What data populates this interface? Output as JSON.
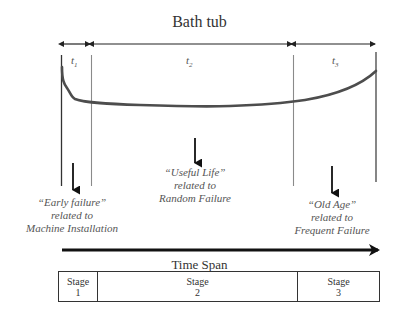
{
  "title": "Bath tub",
  "phases": [
    {
      "id": "t1",
      "label": "t",
      "sub": "1"
    },
    {
      "id": "t2",
      "label": "t",
      "sub": "2"
    },
    {
      "id": "t3",
      "label": "t",
      "sub": "3"
    }
  ],
  "annotations": {
    "early": {
      "line1": "“Early failure”",
      "line2": "related to",
      "line3": "Machine Installation"
    },
    "useful": {
      "line1": "“Useful Life”",
      "line2": "related to",
      "line3": "Random Failure"
    },
    "old": {
      "line1": "“Old Age”",
      "line2": "related to",
      "line3": "Frequent Failure"
    }
  },
  "time_axis": {
    "label": "Time Span"
  },
  "stages": [
    {
      "word": "Stage",
      "number": "1"
    },
    {
      "word": "Stage",
      "number": "2"
    },
    {
      "word": "Stage",
      "number": "3"
    }
  ],
  "colors": {
    "curve": "#4d4d4d",
    "boundary_dark": "#333333",
    "boundary_light": "#8a8a8a",
    "arrow": "#111111",
    "text": "#555555"
  }
}
